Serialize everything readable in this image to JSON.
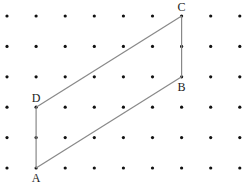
{
  "diagram": {
    "type": "dot-grid-parallelogram",
    "grid": {
      "columns": 9,
      "rows": 6
    },
    "points": [
      {
        "name": "A",
        "col": 1,
        "row": 5,
        "label_pos": "below"
      },
      {
        "name": "B",
        "col": 6,
        "row": 2,
        "label_pos": "below"
      },
      {
        "name": "C",
        "col": 6,
        "row": 0,
        "label_pos": "above"
      },
      {
        "name": "D",
        "col": 1,
        "row": 3,
        "label_pos": "above"
      }
    ],
    "edges": [
      [
        "A",
        "B"
      ],
      [
        "B",
        "C"
      ],
      [
        "C",
        "D"
      ],
      [
        "D",
        "A"
      ]
    ],
    "colors": {
      "dot": "#111111",
      "edge": "#888888",
      "label": "#222222"
    }
  }
}
